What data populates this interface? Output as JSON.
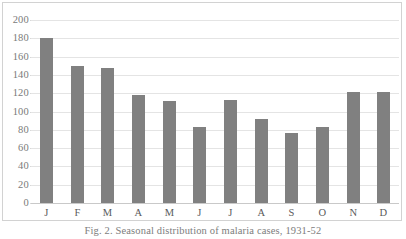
{
  "figure": {
    "caption": "Fig. 2. Seasonal distribution of malaria cases, 1931-52"
  },
  "chart_data": {
    "type": "bar",
    "title": "",
    "xlabel": "",
    "ylabel": "",
    "categories": [
      "J",
      "F",
      "M",
      "A",
      "M",
      "J",
      "J",
      "A",
      "S",
      "O",
      "N",
      "D"
    ],
    "values": [
      180,
      150,
      147,
      118,
      112,
      83,
      113,
      92,
      77,
      83,
      121,
      121
    ],
    "ylim": [
      0,
      200
    ],
    "ytick_labels": [
      "200",
      "180",
      "160",
      "140",
      "120",
      "100",
      "80",
      "60",
      "40",
      "20",
      "0"
    ],
    "ytick_values": [
      200,
      180,
      160,
      140,
      120,
      100,
      80,
      60,
      40,
      20,
      0
    ],
    "grid": true,
    "legend": "none",
    "series_color": "#808080",
    "gridline_color": "#e4e4e4"
  }
}
